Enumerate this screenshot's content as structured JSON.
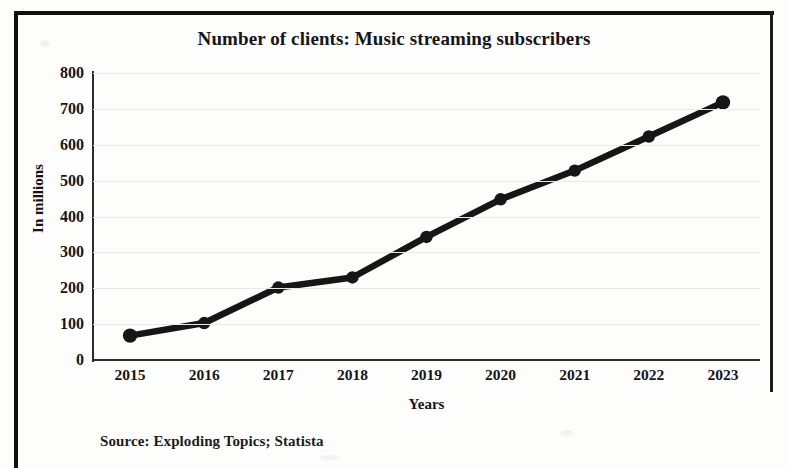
{
  "chart_data": {
    "type": "line",
    "title": "Number of clients: Music streaming subscribers",
    "xlabel": "Years",
    "ylabel": "In millions",
    "categories": [
      "2015",
      "2016",
      "2017",
      "2018",
      "2019",
      "2020",
      "2021",
      "2022",
      "2023"
    ],
    "values": [
      68,
      103,
      202,
      230,
      343,
      448,
      528,
      623,
      718
    ],
    "ylim": [
      0,
      800
    ],
    "yticks": [
      "0",
      "100",
      "200",
      "300",
      "400",
      "500",
      "600",
      "700",
      "800"
    ],
    "ytick_values": [
      0,
      100,
      200,
      300,
      400,
      500,
      600,
      700,
      800
    ],
    "grid": true,
    "legend": "none",
    "series_color": "#161616",
    "marker": "circle",
    "source": "Source: Exploding Topics; Statista"
  },
  "figure": {
    "source_note": "Source: Exploding Topics; Statista"
  }
}
